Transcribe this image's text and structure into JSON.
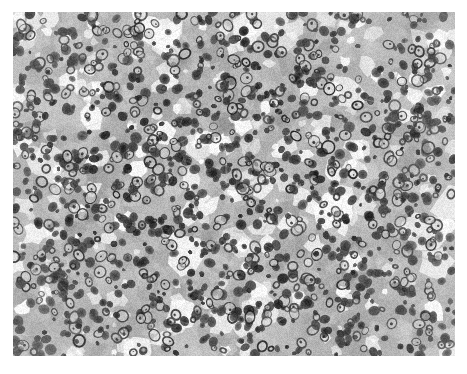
{
  "figure": {
    "kind": "histopathology-micrograph",
    "modality": "brightfield light microscopy",
    "stain": "hematoxylin and eosin (rendered grayscale)",
    "color_mode": "grayscale",
    "caption": "",
    "scale_bar_text": "",
    "annotations": []
  },
  "canvas": {
    "page_width": 467,
    "page_height": 374,
    "image_left": 13,
    "image_top": 12,
    "image_width": 442,
    "image_height": 344,
    "page_background": "#ffffff"
  },
  "appearance": {
    "background_tone": "#b8b8b8",
    "cytoplasm_light": "#cfcfcf",
    "cytoplasm_mid": "#a8a8a8",
    "stroma_dark": "#8e8e8e",
    "nucleus_dark": "#3a3a3a",
    "nucleus_darkest": "#1f1f1f",
    "clear_space": "#fbfbfb",
    "nuclei_count": 1450,
    "clear_space_count": 240,
    "cytoplasm_blob_count": 900
  },
  "render_params": {
    "seed": 20240917,
    "grain_amount": 26,
    "blur_radius_px": 0.6,
    "nucleus_min_radius": 2.2,
    "nucleus_max_radius": 6.4,
    "vesicular_fraction": 0.34,
    "clear_min_radius": 2.0,
    "clear_max_radius": 11.0
  }
}
